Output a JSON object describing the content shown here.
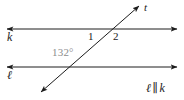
{
  "figure": {
    "background_color": "#ffffff",
    "line_color": "#1c1c1c",
    "label_color": "#1c1c1c",
    "angle_measure_color": "#8c8c8c",
    "width": 184,
    "height": 100
  },
  "lines": {
    "top": {
      "name": "k",
      "label": "k",
      "y": 29,
      "x_start": 6,
      "x_end": 178,
      "arrow_start": true,
      "arrow_end": true
    },
    "bottom": {
      "name": "l",
      "label": "ℓ",
      "y": 67,
      "x_start": 6,
      "x_end": 178,
      "arrow_start": true,
      "arrow_end": true
    },
    "transversal": {
      "name": "t",
      "label": "t",
      "x_start": 40,
      "y_start": 93,
      "x_end": 140,
      "y_end": 5,
      "arrow_start": true,
      "arrow_end": true
    }
  },
  "intersections": {
    "top_line_x": 112,
    "bottom_line_x": 76
  },
  "angles": {
    "one": {
      "label": "1",
      "x": 90,
      "y": 37
    },
    "two": {
      "label": "2",
      "x": 116,
      "y": 37
    },
    "measure": {
      "label": "132°",
      "value": 132,
      "unit": "degrees",
      "x": 68,
      "y": 53
    }
  },
  "statement": {
    "line_a": "ℓ",
    "symbol": "∥",
    "line_b": "k",
    "full_text": "ℓ ∥ k"
  }
}
